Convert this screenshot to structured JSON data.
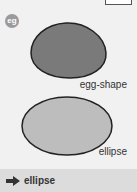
{
  "badge": {
    "label": "eg"
  },
  "shapes": {
    "egg": {
      "label": "egg-shape",
      "fill": "#7a7a7a",
      "stroke": "#222222"
    },
    "ellipse": {
      "label": "ellipse",
      "fill": "#bdbdbd",
      "stroke": "#222222"
    }
  },
  "answer": {
    "icon": "arrow-right-icon",
    "text": "ellipse"
  },
  "colors": {
    "background": "#f1f1f1",
    "answer_bar": "#dcdcdc",
    "badge": "#9a9a9a"
  }
}
